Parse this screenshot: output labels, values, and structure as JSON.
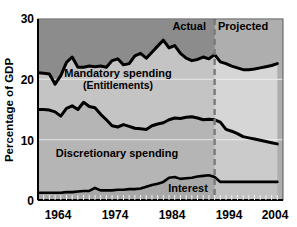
{
  "chart_data": {
    "type": "area",
    "title": "",
    "xlabel": "",
    "ylabel": "Percentage of GDP",
    "ylim": [
      0,
      30
    ],
    "xlim": [
      1962,
      2005
    ],
    "yticks": [
      0,
      10,
      20,
      30
    ],
    "xticks": [
      1964,
      1974,
      1984,
      1994,
      2004
    ],
    "ytick_labels": [
      "0",
      "10",
      "20",
      "30"
    ],
    "xtick_labels": [
      "1964",
      "1974",
      "1984",
      "1994",
      "2004"
    ],
    "grid": true,
    "legend_position": "inline-annotations",
    "stacked": true,
    "divider": {
      "x": 1993,
      "style": "dashed",
      "left_label": "Actual",
      "right_label": "Projected"
    },
    "x": [
      1962,
      1963,
      1964,
      1965,
      1966,
      1967,
      1968,
      1969,
      1970,
      1971,
      1972,
      1973,
      1974,
      1975,
      1976,
      1977,
      1978,
      1979,
      1980,
      1981,
      1982,
      1983,
      1984,
      1985,
      1986,
      1987,
      1988,
      1989,
      1990,
      1991,
      1992,
      1993,
      1994,
      1995,
      1996,
      1997,
      1998,
      1999,
      2000,
      2001,
      2002,
      2003,
      2004
    ],
    "series": [
      {
        "name": "Interest",
        "label": "Interest",
        "fill": "#a8a8a8",
        "values": [
          1.2,
          1.2,
          1.2,
          1.2,
          1.2,
          1.3,
          1.3,
          1.4,
          1.5,
          1.5,
          2.0,
          1.6,
          1.6,
          1.6,
          1.7,
          1.7,
          1.8,
          1.8,
          1.9,
          2.2,
          2.5,
          2.7,
          3.0,
          3.7,
          3.8,
          3.5,
          3.6,
          3.7,
          3.9,
          4.0,
          4.1,
          3.8,
          3.0,
          3.0,
          3.0,
          3.0,
          3.0,
          3.0,
          3.0,
          3.0,
          3.0,
          3.0,
          3.0
        ]
      },
      {
        "name": "Discretionary spending",
        "label": "Discretionary spending",
        "fill": "#b5b5b5",
        "cumulative_top": [
          15.0,
          15.0,
          14.9,
          14.6,
          13.9,
          15.2,
          15.6,
          15.0,
          16.2,
          15.5,
          15.3,
          14.2,
          13.3,
          12.3,
          12.1,
          12.5,
          12.2,
          11.9,
          11.8,
          11.7,
          12.3,
          12.6,
          12.8,
          13.3,
          13.6,
          13.5,
          13.7,
          13.8,
          13.6,
          13.3,
          13.4,
          13.3,
          12.9,
          11.7,
          11.4,
          11.0,
          10.5,
          10.3,
          10.1,
          9.9,
          9.7,
          9.5,
          9.3
        ]
      },
      {
        "name": "Mandatory spending (Entitlements)",
        "label": "Mandatory spending",
        "sublabel": "(Entitlements)",
        "fill": "#c4c4c4",
        "cumulative_top": [
          21.1,
          21.0,
          20.9,
          19.2,
          20.6,
          22.8,
          23.7,
          22.0,
          22.0,
          22.2,
          22.1,
          22.2,
          22.0,
          23.1,
          23.4,
          22.4,
          22.6,
          23.9,
          24.3,
          23.5,
          24.5,
          25.5,
          26.5,
          25.2,
          25.6,
          24.3,
          23.5,
          23.1,
          23.3,
          23.7,
          23.4,
          24.1,
          22.9,
          22.6,
          22.2,
          21.9,
          21.6,
          21.6,
          21.7,
          21.9,
          22.1,
          22.3,
          22.6
        ]
      }
    ],
    "background_above_total": "#8c8c8c",
    "projected_tint": "#d6d6d6",
    "line_color": "#000000",
    "annotations": [
      {
        "text": "Actual",
        "role": "region-label-left"
      },
      {
        "text": "Projected",
        "role": "region-label-right"
      },
      {
        "text": "Mandatory spending",
        "role": "band-label-top"
      },
      {
        "text": "(Entitlements)",
        "role": "band-label-top-sub"
      },
      {
        "text": "Discretionary spending",
        "role": "band-label-middle"
      },
      {
        "text": "Interest",
        "role": "band-label-bottom"
      }
    ]
  },
  "axis": {
    "y_title": "Percentage of GDP",
    "y_ticks": [
      "30",
      "20",
      "10",
      "0"
    ],
    "x_ticks": [
      "1964",
      "1974",
      "1984",
      "1994",
      "2004"
    ]
  },
  "labels": {
    "mandatory_line1": "Mandatory spending",
    "mandatory_line2": "(Entitlements)",
    "discretionary": "Discretionary spending",
    "interest": "Interest",
    "actual": "Actual",
    "projected": "Projected"
  },
  "colors": {
    "above_total": "#8c8c8c",
    "mandatory_band": "#c4c4c4",
    "discretionary_band": "#b5b5b5",
    "interest_band": "#a8a8a8",
    "projected_overlay": "#dcdcdc",
    "line": "#000000",
    "divider": "#7a7a7a",
    "gridline": "#e8e8e8",
    "text": "#000000"
  }
}
